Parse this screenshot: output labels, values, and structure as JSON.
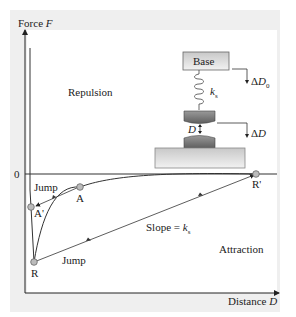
{
  "diagram": {
    "axes": {
      "y_label": "Force",
      "y_symbol": "F",
      "x_label": "Distance",
      "x_symbol": "D",
      "zero_label": "0"
    },
    "regions": {
      "repulsion": "Repulsion",
      "attraction": "Attraction"
    },
    "points": {
      "A": "A",
      "A_prime": "A'",
      "R": "R",
      "R_prime": "R'"
    },
    "annotations": {
      "jump_upper": "Jump",
      "jump_lower": "Jump",
      "slope_prefix": "Slope = ",
      "slope_symbol": "k",
      "slope_sub": "s"
    },
    "apparatus": {
      "base_label": "Base",
      "spring_symbol": "k",
      "spring_sub": "s",
      "gap_symbol": "D",
      "delta_D0_prefix": "Δ",
      "delta_D0_symbol": "D",
      "delta_D0_sub": "0",
      "delta_D_prefix": "Δ",
      "delta_D_symbol": "D"
    },
    "colors": {
      "panel": "#efefef",
      "curve": "#333333",
      "point_fill": "#bbbbbb",
      "base_fill": "#d8d8d8",
      "tip_fill": "#7a7a7a"
    }
  }
}
